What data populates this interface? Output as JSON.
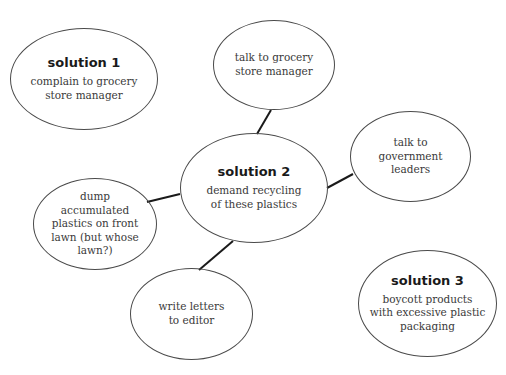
{
  "diagram": {
    "type": "mind-map",
    "line_color": "#1a1a1a",
    "ellipse_border_color": "#4a4a4a",
    "nodes": [
      {
        "id": "solution-1",
        "title": "solution 1",
        "text": "complain to grocery\nstore manager"
      },
      {
        "id": "talk-grocery",
        "title": "",
        "text": "talk to grocery\nstore manager"
      },
      {
        "id": "talk-government",
        "title": "",
        "text": "talk to\ngovernment\nleaders"
      },
      {
        "id": "solution-2",
        "title": "solution 2",
        "text": "demand recycling\nof these plastics"
      },
      {
        "id": "dump-plastics",
        "title": "",
        "text": "dump\naccumulated\nplastics on front\nlawn (but whose\nlawn?)"
      },
      {
        "id": "write-letters",
        "title": "",
        "text": "write letters\nto editor"
      },
      {
        "id": "solution-3",
        "title": "solution 3",
        "text": "boycott products\nwith excessive plastic\npackaging"
      }
    ],
    "edges": [
      {
        "from": "solution-2",
        "to": "talk-grocery"
      },
      {
        "from": "solution-2",
        "to": "talk-government"
      },
      {
        "from": "solution-2",
        "to": "dump-plastics"
      },
      {
        "from": "solution-2",
        "to": "write-letters"
      }
    ]
  }
}
